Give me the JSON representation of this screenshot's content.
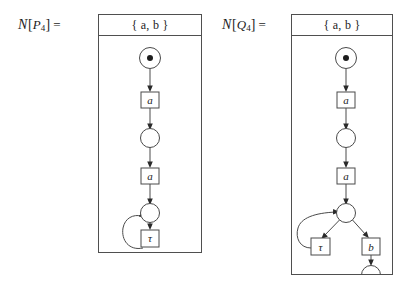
{
  "figure": {
    "caption_left": "N[P4] =",
    "caption_right": "N[Q4] ="
  },
  "nets": [
    {
      "id": "net-p4",
      "equation": {
        "calligraphic_n": "𝒩",
        "open_bracket": "[",
        "process": "P",
        "subscript": "4",
        "close_bracket": "]",
        "equals": "="
      },
      "alphabet_label": "{ a, b }",
      "places": [
        {
          "name": "p0",
          "marked": true,
          "tokens": 1
        },
        {
          "name": "p1",
          "marked": false,
          "tokens": 0
        },
        {
          "name": "p2",
          "marked": false,
          "tokens": 0
        }
      ],
      "transitions": [
        {
          "name": "t0",
          "label": "a"
        },
        {
          "name": "t1",
          "label": "a"
        },
        {
          "name": "t2",
          "label": "τ"
        }
      ],
      "arcs": [
        {
          "from": "p0",
          "to": "t0"
        },
        {
          "from": "t0",
          "to": "p1"
        },
        {
          "from": "p1",
          "to": "t1"
        },
        {
          "from": "t1",
          "to": "p2"
        },
        {
          "from": "p2",
          "to": "t2"
        },
        {
          "from": "t2",
          "to": "p2",
          "shape": "self-loop-left"
        }
      ]
    },
    {
      "id": "net-q4",
      "equation": {
        "calligraphic_n": "𝒩",
        "open_bracket": "[",
        "process": "Q",
        "subscript": "4",
        "close_bracket": "]",
        "equals": "="
      },
      "alphabet_label": "{ a, b }",
      "places": [
        {
          "name": "p0",
          "marked": true,
          "tokens": 1
        },
        {
          "name": "p1",
          "marked": false,
          "tokens": 0
        },
        {
          "name": "p2",
          "marked": false,
          "tokens": 0
        },
        {
          "name": "p3",
          "marked": false,
          "tokens": 0
        }
      ],
      "transitions": [
        {
          "name": "t0",
          "label": "a"
        },
        {
          "name": "t1",
          "label": "a"
        },
        {
          "name": "t2",
          "label": "τ"
        },
        {
          "name": "t3",
          "label": "b"
        }
      ],
      "arcs": [
        {
          "from": "p0",
          "to": "t0"
        },
        {
          "from": "t0",
          "to": "p1"
        },
        {
          "from": "p1",
          "to": "t1"
        },
        {
          "from": "t1",
          "to": "p2"
        },
        {
          "from": "p2",
          "to": "t2",
          "shape": "diagonal-left"
        },
        {
          "from": "t2",
          "to": "p2",
          "shape": "self-loop-left"
        },
        {
          "from": "p2",
          "to": "t3",
          "shape": "diagonal-right"
        },
        {
          "from": "t3",
          "to": "p3"
        }
      ]
    }
  ],
  "colors": {
    "stroke": "#4a4a4a",
    "frame": "#4f4f4f",
    "text": "#1d1d1d",
    "background": "#ffffff"
  }
}
